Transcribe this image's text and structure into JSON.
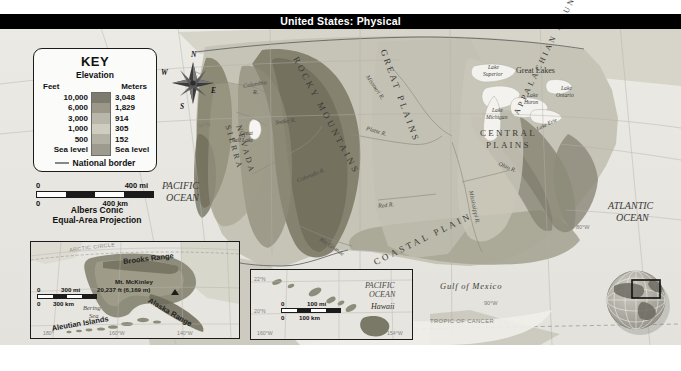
{
  "title": "United States: Physical",
  "key": {
    "title": "KEY",
    "subtitle": "Elevation",
    "col_feet": "Feet",
    "col_meters": "Meters",
    "rows": [
      {
        "feet": "10,000",
        "meters": "3,048",
        "color": "#7d7a6e"
      },
      {
        "feet": "6,000",
        "meters": "1,829",
        "color": "#9b9889"
      },
      {
        "feet": "3,000",
        "meters": "914",
        "color": "#b9b7a9"
      },
      {
        "feet": "1,000",
        "meters": "305",
        "color": "#cfcdc0"
      },
      {
        "feet": "500",
        "meters": "152",
        "color": "#b3b1a3"
      },
      {
        "feet": "Sea level",
        "meters": "Sea level",
        "color": "#9d9b8d"
      }
    ],
    "border_label": "National border"
  },
  "compass": {
    "n": "N",
    "e": "E",
    "s": "S",
    "w": "W"
  },
  "scale_main": {
    "miles_zero": "0",
    "miles_label": "400 mi",
    "km_zero": "0",
    "km_label": "400 km"
  },
  "projection": "Albers Conic\nEqual-Area Projection",
  "projection_line1": "Albers Conic",
  "projection_line2": "Equal-Area Projection",
  "regions": [
    {
      "name": "ROCKY MOUNTAINS"
    },
    {
      "name": "SIERRA NEVADA"
    },
    {
      "name": "GREAT PLAINS"
    },
    {
      "name": "CENTRAL PLAINS"
    },
    {
      "name": "APPALACHIAN MOUNTAINS"
    },
    {
      "name": "COASTAL PLAIN"
    }
  ],
  "region_rocky": "ROCKY MOUNTAINS",
  "region_sierra_1": "SIERRA",
  "region_sierra_2": "NEVADA",
  "region_great_plains": "GREAT PLAINS",
  "region_central_1": "CENTRAL",
  "region_central_2": "PLAINS",
  "region_appalachian": "APPALACHIAN MOUNTAINS",
  "region_coastal": "COASTAL PLAIN",
  "rivers": {
    "columbia_1": "Columbia",
    "columbia_2": "R.",
    "snake": "Snake R.",
    "colorado": "Colorado R.",
    "missouri": "Missouri R.",
    "platte": "Platte R.",
    "red": "Red R.",
    "rio_grande": "Rio Grande",
    "mississippi": "Mississippi R.",
    "ohio": "Ohio R."
  },
  "lakes": {
    "great_salt_1": "Great",
    "great_salt_2": "Salt Lake",
    "superior_1": "Lake",
    "superior_2": "Superior",
    "michigan_1": "Lake",
    "michigan_2": "Michigan",
    "huron_1": "Lake",
    "huron_2": "Huron",
    "erie": "Lake Erie",
    "ontario_1": "Lake",
    "ontario_2": "Ontario",
    "great_lakes": "Great Lakes"
  },
  "oceans": {
    "pacific_1": "PACIFIC",
    "pacific_2": "OCEAN",
    "atlantic_1": "ATLANTIC",
    "atlantic_2": "OCEAN",
    "gulf": "Gulf of Mexico"
  },
  "grid_labels": {
    "lat40n": "40°N",
    "lon80w": "80°W",
    "lon90w": "90°W",
    "tropic": "TROPIC OF CANCER"
  },
  "alaska_inset": {
    "brooks_range": "Brooks Range",
    "alaska_range": "Alaska Range",
    "mckinley_1": "Mt. McKinley",
    "mckinley_2": "20,237 ft (6,169 m)",
    "bering_1": "Bering",
    "bering_2": "Sea",
    "aleutian": "Aleutian Islands",
    "arctic_circle": "ARCTIC CIRCLE",
    "lon180": "180°",
    "lon160w": "160°W",
    "lon140w": "140°W",
    "scale_miles_zero": "0",
    "scale_miles": "300 mi",
    "scale_km_zero": "0",
    "scale_km": "300 km"
  },
  "hawaii_inset": {
    "ocean_1": "PACIFIC",
    "ocean_2": "OCEAN",
    "name": "Hawaii",
    "lat22n": "22°N",
    "lat20n": "20°N",
    "lon160w": "160°W",
    "lon154w": "154°W",
    "scale_miles_zero": "0",
    "scale_miles": "100 mi",
    "scale_km_zero": "0",
    "scale_km": "100 km"
  },
  "colors": {
    "title_band": "#000000",
    "title_text": "#ffffff",
    "ocean": "#e9e7e2",
    "land_low": "#cfcdc0",
    "land_high": "#7d7a6e",
    "border_line": "#55555a"
  }
}
